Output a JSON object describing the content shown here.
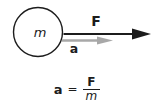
{
  "diagram": {
    "mass_label": "m",
    "force_label": "F",
    "acceleration_label": "a",
    "colors": {
      "outline": "#1c1c1c",
      "force_arrow": "#1c1c1c",
      "acceleration_arrow": "#a8a8a8",
      "background": "#ffffff"
    }
  },
  "equation": {
    "lhs": "a",
    "equals": "=",
    "numerator": "F",
    "denominator": "m"
  }
}
